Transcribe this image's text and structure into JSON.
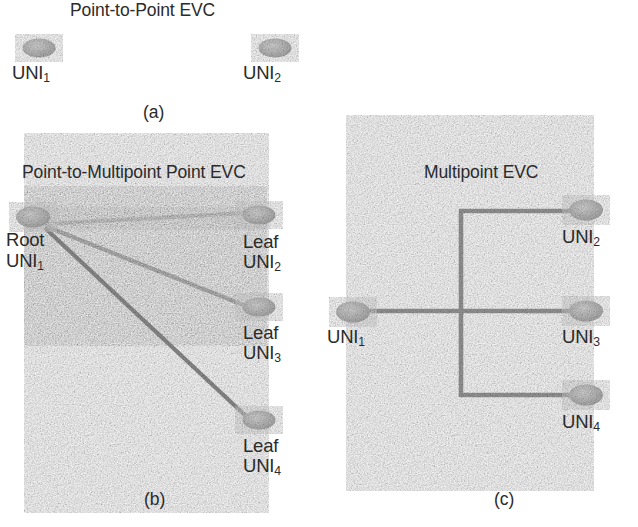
{
  "figure": {
    "background_color": "#ffffff",
    "node_fill_color": "#b4b4b4",
    "line_color": "#8a8a8a",
    "text_color": "#2b2b2b"
  },
  "panels": [
    {
      "id": "a",
      "title": "Point-to-Point EVC",
      "caption": "(a)",
      "topology_type": "point-to-point",
      "nodes": [
        {
          "name": "uni-1",
          "label_main": "UNI",
          "label_sub": "1",
          "role": "",
          "cx": 39,
          "cy": 48,
          "rx": 16,
          "ry": 9
        },
        {
          "name": "uni-2",
          "label_main": "UNI",
          "label_sub": "2",
          "role": "",
          "cx": 275,
          "cy": 48,
          "rx": 16,
          "ry": 9
        }
      ],
      "links": [
        {
          "from": "uni-1",
          "to": "uni-2",
          "x1": 52,
          "y1": 48,
          "x2": 262,
          "y2": 48
        }
      ]
    },
    {
      "id": "b",
      "title": "Point-to-Multipoint Point EVC",
      "caption": "(b)",
      "topology_type": "point-to-multipoint",
      "nodes": [
        {
          "name": "root-uni-1",
          "label_main": "UNI",
          "label_sub": "1",
          "role": "Root",
          "cx": 33,
          "cy": 217,
          "rx": 16,
          "ry": 10
        },
        {
          "name": "leaf-uni-2",
          "label_main": "UNI",
          "label_sub": "2",
          "role": "Leaf",
          "cx": 259,
          "cy": 215,
          "rx": 16,
          "ry": 9
        },
        {
          "name": "leaf-uni-3",
          "label_main": "UNI",
          "label_sub": "3",
          "role": "Leaf",
          "cx": 259,
          "cy": 307,
          "rx": 16,
          "ry": 9
        },
        {
          "name": "leaf-uni-4",
          "label_main": "UNI",
          "label_sub": "4",
          "role": "Leaf",
          "cx": 259,
          "cy": 420,
          "rx": 16,
          "ry": 9
        }
      ],
      "links": [
        {
          "from": "root-uni-1",
          "to": "leaf-uni-2",
          "x1": 45,
          "y1": 224,
          "x2": 245,
          "y2": 213
        },
        {
          "from": "root-uni-1",
          "to": "leaf-uni-3",
          "x1": 45,
          "y1": 226,
          "x2": 245,
          "y2": 306
        },
        {
          "from": "root-uni-1",
          "to": "leaf-uni-4",
          "x1": 45,
          "y1": 228,
          "x2": 247,
          "y2": 418
        }
      ]
    },
    {
      "id": "c",
      "title": "Multipoint EVC",
      "caption": "(c)",
      "topology_type": "multipoint-bus",
      "nodes": [
        {
          "name": "uni-1",
          "label_main": "UNI",
          "label_sub": "1",
          "role": "",
          "cx": 353,
          "cy": 312,
          "rx": 16,
          "ry": 10
        },
        {
          "name": "uni-2",
          "label_main": "UNI",
          "label_sub": "2",
          "role": "",
          "cx": 586,
          "cy": 210,
          "rx": 16,
          "ry": 10
        },
        {
          "name": "uni-3",
          "label_main": "UNI",
          "label_sub": "3",
          "role": "",
          "cx": 586,
          "cy": 311,
          "rx": 16,
          "ry": 10
        },
        {
          "name": "uni-4",
          "label_main": "UNI",
          "label_sub": "4",
          "role": "",
          "cx": 586,
          "cy": 395,
          "rx": 16,
          "ry": 10
        }
      ],
      "bus": {
        "vertical_x": 461,
        "vertical_y_top": 211,
        "vertical_y_bottom": 395,
        "branch_top_y": 211,
        "branch_middle_y": 311,
        "branch_bottom_y": 395,
        "left_stub_x": 367,
        "right_end_x": 572
      }
    }
  ]
}
